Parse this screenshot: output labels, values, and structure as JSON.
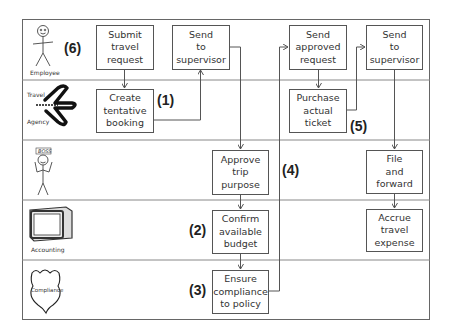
{
  "lanes": [
    {
      "name": "Employee",
      "icon": "stick-figure-icon"
    },
    {
      "name": "Travel Agency",
      "icon": "airplane-icon"
    },
    {
      "name": "BOSS",
      "icon": "boss-stick-figure-icon"
    },
    {
      "name": "Accounting",
      "icon": "computer-monitor-icon"
    },
    {
      "name": "Compliance",
      "icon": "shield-badge-icon"
    }
  ],
  "lane_labels": {
    "employee": "Employee",
    "travel_line1": "Travel",
    "travel_line2": "Agency",
    "boss": "BOSS",
    "accounting": "Accounting",
    "compliance": "Compliance"
  },
  "steps": {
    "submit": "Submit\ntravel\nrequest",
    "send_supervisor_1": "Send\nto\nsupervisor",
    "create_booking": "Create\ntentative\nbooking",
    "approve": "Approve\ntrip\npurpose",
    "confirm_budget": "Confirm\navailable\nbudget",
    "ensure_compliance": "Ensure\ncompliance\nto policy",
    "send_approved": "Send\napproved\nrequest",
    "send_supervisor_2": "Send\nto\nsupervisor",
    "purchase_ticket": "Purchase\nactual\nticket",
    "file_forward": "File\nand\nforward",
    "accrue_expense": "Accrue\ntravel\nexpense"
  },
  "markers": {
    "m1": "(1)",
    "m2": "(2)",
    "m3": "(3)",
    "m4": "(4)",
    "m5": "(5)",
    "m6": "(6)"
  },
  "colors": {
    "line": "#555555",
    "lane_divider": "#888888",
    "text": "#333333"
  }
}
